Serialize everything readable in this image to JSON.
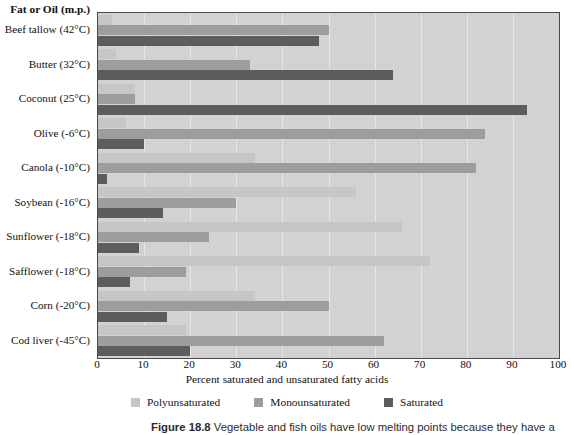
{
  "figure": {
    "caption_label": "Figure 18.8",
    "caption_text": "Vegetable and fish oils have low melting points because they have a"
  },
  "chart_data": {
    "type": "bar",
    "orientation": "horizontal-grouped",
    "title": "",
    "category_header": "Fat or Oil (m.p.)",
    "xlabel": "Percent saturated and unsaturated fatty acids",
    "ylabel": "",
    "xlim": [
      0,
      100
    ],
    "xticks": [
      0,
      10,
      20,
      30,
      40,
      50,
      60,
      70,
      80,
      90,
      100
    ],
    "xtick_labels": [
      "0",
      "10",
      "20",
      "30",
      "40",
      "50",
      "60",
      "70",
      "80",
      "90",
      "100"
    ],
    "grid": "vertical",
    "legend_position": "bottom-center",
    "categories": [
      "Beef tallow (42°C)",
      "Butter (32°C)",
      "Coconut (25°C)",
      "Olive (-6°C)",
      "Canola (-10°C)",
      "Soybean (-16°C)",
      "Sunflower (-18°C)",
      "Safflower (-18°C)",
      "Corn (-20°C)",
      "Cod liver (-45°C)"
    ],
    "series": [
      {
        "name": "Polyunsaturated",
        "color": "#c6c6c6",
        "values": [
          3,
          4,
          8,
          6,
          34,
          56,
          66,
          72,
          34,
          19
        ]
      },
      {
        "name": "Monounsaturated",
        "color": "#9d9d9d",
        "values": [
          50,
          33,
          8,
          84,
          82,
          30,
          24,
          19,
          50,
          62
        ]
      },
      {
        "name": "Saturated",
        "color": "#5d5d5d",
        "values": [
          48,
          64,
          93,
          10,
          2,
          14,
          9,
          7,
          15,
          20
        ]
      }
    ]
  },
  "colors": {
    "plot_background": "#d2d2d2",
    "gridline": "#e6e6e6",
    "axis_line": "#4a4a4a",
    "polyunsaturated": "#c6c6c6",
    "monounsaturated": "#9d9d9d",
    "saturated": "#5d5d5d"
  }
}
